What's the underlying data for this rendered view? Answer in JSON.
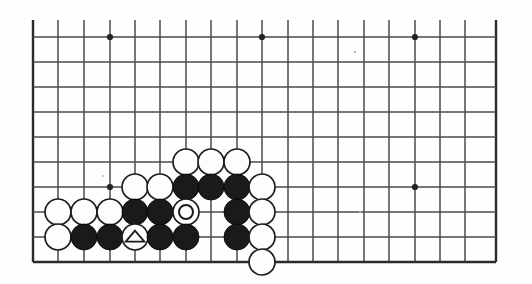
{
  "figure": {
    "name": "go-board-diagram",
    "kind": "go-board-position-diagram",
    "paper_color": "#fefefe",
    "line_color": "#4a4a4a",
    "edge_line_color": "#2b2b2b",
    "black_stone_color": "#1a1a1a",
    "white_stone_color": "#fdfdfd",
    "marker_color": "#1c1c1c"
  },
  "grid": {
    "columns": 19,
    "rows": 10,
    "spacing_px": 25.4,
    "origin_x": 33,
    "origin_y": 37,
    "bottom_edge_y": 262,
    "right_edge_x": 496,
    "top_is_cut_off": true,
    "bottom_is_board_edge": true,
    "x_positions": [
      33,
      58,
      84,
      110,
      135,
      160,
      186,
      211,
      237,
      262,
      288,
      313,
      338,
      364,
      389,
      415,
      440,
      465,
      496
    ],
    "y_positions": [
      37,
      62,
      87,
      112,
      137,
      162,
      187,
      212,
      237,
      262
    ],
    "stub_top_y": 20
  },
  "star_points": [
    {
      "col": 3,
      "row": 0,
      "x": 110,
      "y": 37
    },
    {
      "col": 9,
      "row": 0,
      "x": 262,
      "y": 37
    },
    {
      "col": 15,
      "row": 0,
      "x": 415,
      "y": 37
    },
    {
      "col": 3,
      "row": 6,
      "x": 110,
      "y": 187
    },
    {
      "col": 15,
      "row": 6,
      "x": 415,
      "y": 187
    }
  ],
  "stones": [
    {
      "id": "w-c4-r5",
      "color": "white",
      "marker": "none",
      "x": 186,
      "y": 162,
      "col": 6,
      "row": 5
    },
    {
      "id": "w-c7-r5",
      "color": "white",
      "marker": "none",
      "x": 211,
      "y": 162,
      "col": 7,
      "row": 5
    },
    {
      "id": "w-c8-r5",
      "color": "white",
      "marker": "none",
      "x": 237,
      "y": 162,
      "col": 8,
      "row": 5
    },
    {
      "id": "w-c4-r6",
      "color": "white",
      "marker": "none",
      "x": 135,
      "y": 187,
      "col": 4,
      "row": 6
    },
    {
      "id": "w-c5-r6",
      "color": "white",
      "marker": "none",
      "x": 160,
      "y": 187,
      "col": 5,
      "row": 6
    },
    {
      "id": "b-c6-r6",
      "color": "black",
      "marker": "none",
      "x": 186,
      "y": 187,
      "col": 6,
      "row": 6
    },
    {
      "id": "b-c7-r6",
      "color": "black",
      "marker": "none",
      "x": 211,
      "y": 187,
      "col": 7,
      "row": 6
    },
    {
      "id": "b-c8-r6",
      "color": "black",
      "marker": "none",
      "x": 237,
      "y": 187,
      "col": 8,
      "row": 6
    },
    {
      "id": "w-c9-r6",
      "color": "white",
      "marker": "none",
      "x": 262,
      "y": 187,
      "col": 9,
      "row": 6
    },
    {
      "id": "w-c1-r7",
      "color": "white",
      "marker": "none",
      "x": 58,
      "y": 212,
      "col": 1,
      "row": 7
    },
    {
      "id": "w-c2-r7",
      "color": "white",
      "marker": "none",
      "x": 84,
      "y": 212,
      "col": 2,
      "row": 7
    },
    {
      "id": "w-c3-r7",
      "color": "white",
      "marker": "none",
      "x": 110,
      "y": 212,
      "col": 3,
      "row": 7
    },
    {
      "id": "b-c4-r7",
      "color": "black",
      "marker": "none",
      "x": 135,
      "y": 212,
      "col": 4,
      "row": 7
    },
    {
      "id": "b-c5-r7",
      "color": "black",
      "marker": "none",
      "x": 160,
      "y": 212,
      "col": 5,
      "row": 7
    },
    {
      "id": "w-c6-r7-circle",
      "color": "white",
      "marker": "circle",
      "x": 186,
      "y": 212,
      "col": 6,
      "row": 7
    },
    {
      "id": "b-c8-r7",
      "color": "black",
      "marker": "none",
      "x": 237,
      "y": 212,
      "col": 8,
      "row": 7
    },
    {
      "id": "w-c9-r7",
      "color": "white",
      "marker": "none",
      "x": 262,
      "y": 212,
      "col": 9,
      "row": 7
    },
    {
      "id": "w-c1-r8",
      "color": "white",
      "marker": "none",
      "x": 58,
      "y": 237,
      "col": 1,
      "row": 8
    },
    {
      "id": "b-c2-r8",
      "color": "black",
      "marker": "none",
      "x": 84,
      "y": 237,
      "col": 2,
      "row": 8
    },
    {
      "id": "b-c3-r8",
      "color": "black",
      "marker": "none",
      "x": 110,
      "y": 237,
      "col": 3,
      "row": 8
    },
    {
      "id": "w-c4-r8-triangle",
      "color": "white",
      "marker": "triangle",
      "x": 135,
      "y": 237,
      "col": 4,
      "row": 8
    },
    {
      "id": "b-c5-r8",
      "color": "black",
      "marker": "none",
      "x": 160,
      "y": 237,
      "col": 5,
      "row": 8
    },
    {
      "id": "b-c6-r8",
      "color": "black",
      "marker": "none",
      "x": 186,
      "y": 237,
      "col": 6,
      "row": 8
    },
    {
      "id": "b-c8-r8",
      "color": "black",
      "marker": "none",
      "x": 237,
      "y": 237,
      "col": 8,
      "row": 8
    },
    {
      "id": "w-c9-r8",
      "color": "white",
      "marker": "none",
      "x": 262,
      "y": 237,
      "col": 9,
      "row": 8
    },
    {
      "id": "w-c9-r9",
      "color": "white",
      "marker": "none",
      "x": 262,
      "y": 262,
      "col": 9,
      "row": 9
    }
  ],
  "stone_radius_px": 13,
  "marker_circle_radius_px": 7,
  "marker_triangle_size_px": 13,
  "specks": [
    {
      "x": 355,
      "y": 52,
      "r": 1.2
    },
    {
      "x": 103,
      "y": 176,
      "r": 1.0
    },
    {
      "x": 186,
      "y": 151,
      "r": 0.9
    },
    {
      "x": 360,
      "y": 212,
      "r": 1.0
    }
  ],
  "counts": {
    "black_stones": 11,
    "white_stones": 14,
    "marked_stones": 2,
    "total_stones": 25
  }
}
